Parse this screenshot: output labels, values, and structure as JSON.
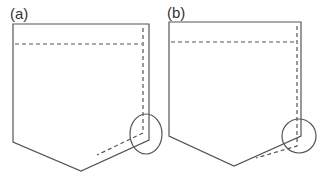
{
  "figure": {
    "type": "technical-sketch",
    "stroke_color": "#555555",
    "panels": [
      {
        "label": "(a)",
        "outline": "13,24 149,24 149,140 81,171 13,142",
        "stitch_top": "15,44 142,44",
        "stitch_side": "143,28 143,133 97,155",
        "circle": {
          "cx": 146,
          "cy": 134,
          "rx": 16,
          "ry": 20
        }
      },
      {
        "label": "(b)",
        "outline": "169,22 301,22 301,136 234,166 169,136",
        "stitch_top": "171,42 294,42",
        "stitch_side": "297,26 297,146 256,158",
        "circle": {
          "cx": 299,
          "cy": 136,
          "rx": 17,
          "ry": 17
        }
      }
    ]
  }
}
